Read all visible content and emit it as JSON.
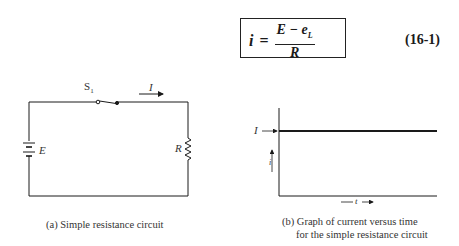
{
  "equation": {
    "lhs": "i",
    "equals": "=",
    "numerator": "E − e",
    "numerator_subscript": "L",
    "denominator": "R",
    "number": "(16-1)"
  },
  "circuit": {
    "switch_label": "S",
    "switch_subscript": "1",
    "current_label": "I",
    "source_label": "E",
    "resistor_label": "R",
    "caption": "(a) Simple resistance circuit"
  },
  "graph": {
    "level_label": "I",
    "y_axis_label": "i",
    "x_axis_label": "t",
    "caption_line1": "(b)  Graph of current versus time",
    "caption_line2": "for the simple resistance circuit"
  },
  "colors": {
    "ink": "#1a1a1a",
    "background": "#ffffff"
  }
}
